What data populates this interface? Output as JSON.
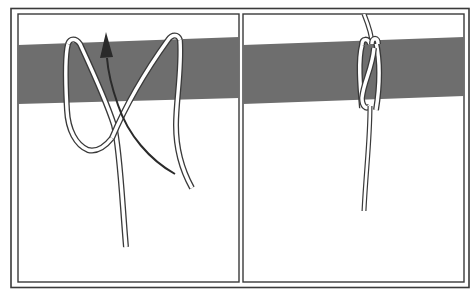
{
  "figure": {
    "type": "two-panel knot-tying illustration",
    "panels": [
      {
        "id": "step-1",
        "description": "Cord passed around a horizontal bar forming an X-shaped loop, with arrow showing working end pulled upward through the loop"
      },
      {
        "id": "step-2",
        "description": "Finished knot: cord wrapped tightly around the bar with two turns, single standing line hanging below"
      }
    ],
    "colors": {
      "background": "#ffffff",
      "frame": "#3a3a3a",
      "bar": "#6e6e6e",
      "cord_fill": "#ffffff",
      "cord_outline": "#3a3a3a",
      "arrow": "#2a2a2a"
    }
  }
}
